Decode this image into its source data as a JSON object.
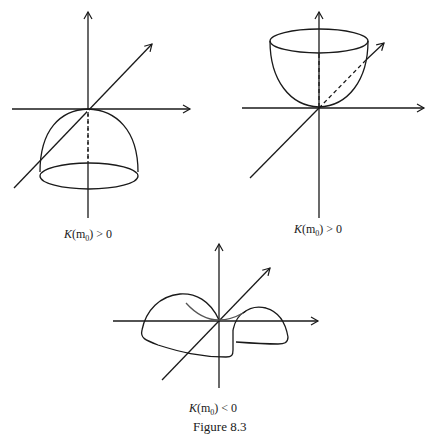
{
  "figure": {
    "caption": "Figure 8.3",
    "panels": [
      {
        "id": "dome",
        "label_k": "K",
        "label_arg": "(m",
        "label_sub": "0",
        "label_rest": ") > 0",
        "description": "downward dome (cap) below tangent plane"
      },
      {
        "id": "bowl",
        "label_k": "K",
        "label_arg": "(m",
        "label_sub": "0",
        "label_rest": ") > 0",
        "description": "upward bowl above tangent plane"
      },
      {
        "id": "saddle",
        "label_k": "K",
        "label_arg": "(m",
        "label_sub": "0",
        "label_rest": ") < 0",
        "description": "saddle surface"
      }
    ]
  },
  "colors": {
    "stroke": "#1a1a1a",
    "background": "#ffffff"
  }
}
